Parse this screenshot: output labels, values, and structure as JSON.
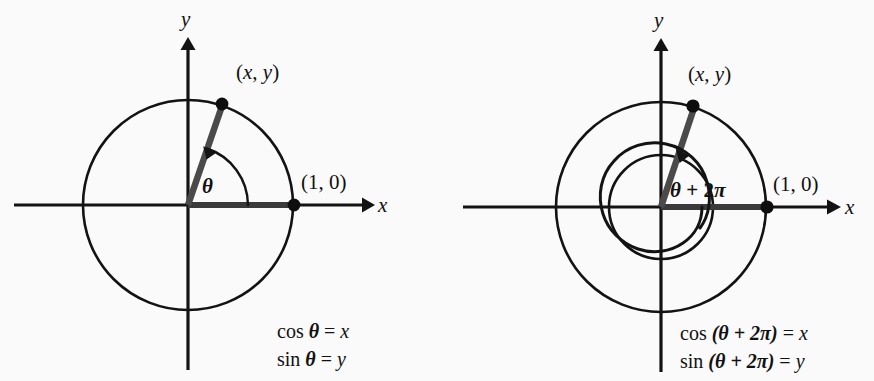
{
  "figure": {
    "type": "diagram",
    "background_color": "#fafafa",
    "ink_color": "#131313",
    "panels": [
      {
        "id": "left",
        "name": "angle-theta-panel",
        "axis_labels": {
          "x": "x",
          "y": "y"
        },
        "point_label": "(x, y)",
        "point_label_open": "(",
        "point_label_x": "x",
        "point_label_comma": ", ",
        "point_label_y": "y",
        "point_label_close": ")",
        "intercept_label": "(1, 0)",
        "angle_label": "θ",
        "circles": [
          {
            "name": "unit-circle",
            "radius_px": 105
          }
        ],
        "equations": [
          {
            "fn": "cos",
            "arg": "θ",
            "eq": "=",
            "result": "x",
            "text": "cos θ = x"
          },
          {
            "fn": "sin",
            "arg": "θ",
            "eq": "=",
            "result": "y",
            "text": "sin θ = y"
          }
        ]
      },
      {
        "id": "right",
        "name": "angle-theta-plus-two-pi-panel",
        "axis_labels": {
          "x": "x",
          "y": "y"
        },
        "point_label": "(x, y)",
        "point_label_open": "(",
        "point_label_x": "x",
        "point_label_comma": ", ",
        "point_label_y": "y",
        "point_label_close": ")",
        "intercept_label": "(1, 0)",
        "angle_label_theta": "θ",
        "angle_label_plus": "+",
        "angle_label_two": "2",
        "angle_label_pi": "π",
        "angle_label": "θ + 2π",
        "circles": [
          {
            "name": "inner-circle",
            "radius_px": 52
          },
          {
            "name": "unit-circle",
            "radius_px": 105
          }
        ],
        "equations": [
          {
            "fn": "cos",
            "arg": "(θ + 2π)",
            "eq": "=",
            "result": "x",
            "text": "cos (θ + 2π) = x"
          },
          {
            "fn": "sin",
            "arg": "(θ + 2π)",
            "eq": "=",
            "result": "y",
            "text": "sin (θ + 2π) = y"
          }
        ]
      }
    ]
  }
}
